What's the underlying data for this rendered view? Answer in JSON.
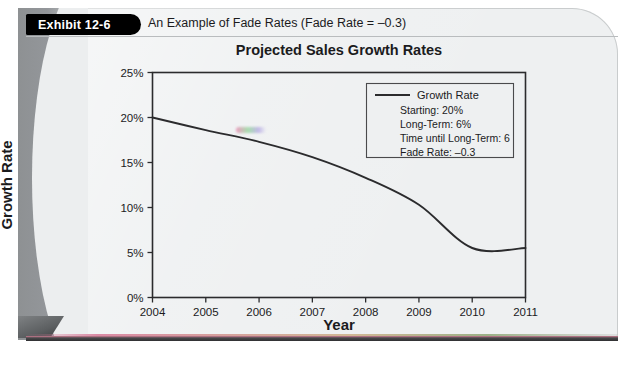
{
  "exhibit": {
    "tab_label": "Exhibit 12-6",
    "title": "An Example of Fade Rates (Fade Rate = –0.3)"
  },
  "chart_data": {
    "type": "line",
    "title": "Projected Sales Growth Rates",
    "xlabel": "Year",
    "ylabel": "Growth Rate",
    "x": [
      2004,
      2005,
      2006,
      2007,
      2008,
      2009,
      2010,
      2011
    ],
    "xtick_labels": [
      "2004",
      "2005",
      "2006",
      "2007",
      "2008",
      "2009",
      "2010",
      "2011"
    ],
    "xlim": [
      2004,
      2011
    ],
    "ylim": [
      0,
      25
    ],
    "ytick_values": [
      0,
      5,
      10,
      15,
      20,
      25
    ],
    "ytick_labels": [
      "0%",
      "5%",
      "10%",
      "15%",
      "20%",
      "25%"
    ],
    "grid": false,
    "legend_position": "upper right",
    "series": [
      {
        "name": "Growth Rate",
        "color": "#2b2b2d",
        "values": [
          20.0,
          18.6,
          17.3,
          15.6,
          13.3,
          10.3,
          5.5,
          5.5
        ]
      }
    ],
    "annotations": {
      "starting_label": "Starting:  20%",
      "long_term_label": "Long-Term:  6%",
      "time_until_long_term_label": "Time until Long-Term: 6",
      "fade_rate_label": "Fade Rate:  –0.3"
    }
  }
}
